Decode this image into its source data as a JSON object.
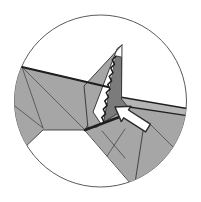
{
  "figure": {
    "background": "#ffffff"
  },
  "canvas": {
    "width": 201,
    "height": 202
  },
  "lens": {
    "cx": 100.5,
    "cy": 101,
    "r": 86
  },
  "palette": {
    "paper_gray": "#a6a6a6",
    "paper_dark": "#7b7b7b",
    "edge_strip": "#b5b5b5",
    "outline": "#3d3d3d",
    "crease": "#4a4a4a",
    "heavy_line": "#1f1f1f",
    "serration": "#1c1c1c",
    "circle_stroke": "#5a5a5a",
    "white": "#ffffff",
    "arrow_fill": "#ffffff",
    "arrow_outline": "#2b2b2b"
  },
  "shapes": [
    {
      "name": "lens-circle",
      "kind": "circle",
      "cx": 100.5,
      "cy": 101,
      "r": 86,
      "fill": "white",
      "stroke": "circle_stroke",
      "width": 1,
      "clip": false
    },
    {
      "name": "left-panel",
      "kind": "polygon",
      "points": [
        [
          22,
          67
        ],
        [
          108,
          87
        ],
        [
          85,
          130
        ],
        [
          43,
          130
        ],
        [
          23,
          149
        ],
        [
          5,
          142
        ],
        [
          5,
          72
        ]
      ],
      "fill": "paper_gray",
      "stroke": "outline",
      "width": 0.9,
      "clip": true
    },
    {
      "name": "left-panel-crease-a",
      "kind": "line",
      "x1": 22,
      "y1": 67,
      "x2": 85,
      "y2": 130,
      "stroke": "crease",
      "width": 0.8,
      "clip": true
    },
    {
      "name": "left-panel-crease-b",
      "kind": "line",
      "x1": 11,
      "y1": 103,
      "x2": 43,
      "y2": 128,
      "stroke": "crease",
      "width": 0.8,
      "clip": true
    },
    {
      "name": "left-panel-crease-c",
      "kind": "line",
      "x1": 22,
      "y1": 67,
      "x2": 43,
      "y2": 128,
      "stroke": "crease",
      "width": 0.8,
      "clip": true
    },
    {
      "name": "lower-panel",
      "kind": "polygon",
      "points": [
        [
          85,
          130
        ],
        [
          107,
          103
        ],
        [
          200,
          116
        ],
        [
          200,
          215
        ],
        [
          158,
          215
        ]
      ],
      "fill": "paper_gray",
      "stroke": "outline",
      "width": 0.9,
      "clip": true
    },
    {
      "name": "lower-panel-crease-a",
      "kind": "line",
      "x1": 102,
      "y1": 131,
      "x2": 125,
      "y2": 158,
      "stroke": "crease",
      "width": 0.8,
      "clip": true
    },
    {
      "name": "lower-panel-crease-b",
      "kind": "line",
      "x1": 125,
      "y1": 129,
      "x2": 107,
      "y2": 156,
      "stroke": "crease",
      "width": 0.8,
      "clip": true
    },
    {
      "name": "lower-panel-crease-c",
      "kind": "line",
      "x1": 143,
      "y1": 131,
      "x2": 135,
      "y2": 183,
      "stroke": "crease",
      "width": 1.1,
      "clip": true
    },
    {
      "name": "lower-panel-crease-d",
      "kind": "line",
      "x1": 148,
      "y1": 122,
      "x2": 178,
      "y2": 152,
      "stroke": "crease",
      "width": 0.8,
      "clip": true
    },
    {
      "name": "paper-edge-strip",
      "kind": "polygon",
      "points": [
        [
          120,
          97
        ],
        [
          187,
          108.5
        ],
        [
          189,
          116
        ],
        [
          106,
          103.5
        ]
      ],
      "fill": "edge_strip",
      "stroke": "none",
      "width": 0,
      "clip": true
    },
    {
      "name": "paper-edge-strip-top-line",
      "kind": "line",
      "x1": 120,
      "y1": 97,
      "x2": 187,
      "y2": 108.5,
      "stroke": "heavy_line",
      "width": 1.7,
      "clip": true
    },
    {
      "name": "paper-edge-strip-bottom-line",
      "kind": "line",
      "x1": 106,
      "y1": 103.5,
      "x2": 189,
      "y2": 116,
      "stroke": "heavy_line",
      "width": 1.3,
      "clip": true
    },
    {
      "name": "pocket-face",
      "kind": "polygon",
      "points": [
        [
          116,
          56
        ],
        [
          121.5,
          57
        ],
        [
          121.5,
          99
        ],
        [
          128,
          107
        ],
        [
          104,
          122
        ]
      ],
      "fill": "paper_dark",
      "stroke": "arrow_outline",
      "width": 0.8,
      "clip": true
    },
    {
      "name": "white-gap",
      "kind": "polygon",
      "points": [
        [
          117,
          49
        ],
        [
          93,
          112
        ],
        [
          101,
          124
        ],
        [
          103,
          121
        ],
        [
          115,
          55
        ]
      ],
      "fill": "white",
      "stroke": "none",
      "width": 0,
      "clip": true
    },
    {
      "name": "spike-flap",
      "kind": "polygon",
      "points": [
        [
          122,
          45
        ],
        [
          84,
          86
        ],
        [
          88,
          128
        ],
        [
          97,
          127
        ],
        [
          101,
          124
        ],
        [
          93,
          112
        ],
        [
          117,
          49
        ]
      ],
      "fill": "paper_gray",
      "stroke": "outline",
      "width": 1,
      "clip": true
    },
    {
      "name": "pocket-serrated-edge",
      "kind": "polyline",
      "points": [
        [
          104,
          122
        ],
        [
          101.8,
          117.4
        ],
        [
          105.5,
          113.8
        ],
        [
          103.3,
          109.2
        ],
        [
          107,
          105.6
        ],
        [
          104.8,
          100.9
        ],
        [
          108.5,
          97.3
        ],
        [
          106.3,
          92.7
        ],
        [
          110,
          89.1
        ],
        [
          107.8,
          84.5
        ],
        [
          111.5,
          80.9
        ],
        [
          109.3,
          76.3
        ],
        [
          113,
          72.7
        ],
        [
          110.8,
          68
        ],
        [
          114.5,
          64.4
        ],
        [
          112.3,
          59.8
        ],
        [
          116,
          56.2
        ]
      ],
      "fill": "none",
      "stroke": "serration",
      "width": 1.5,
      "clip": true
    },
    {
      "name": "spike-right-edge",
      "kind": "line",
      "x1": 122,
      "y1": 45,
      "x2": 121.5,
      "y2": 99,
      "stroke": "outline",
      "width": 1,
      "clip": true
    },
    {
      "name": "main-fold-heavy-edge",
      "kind": "line",
      "x1": 22,
      "y1": 67,
      "x2": 108,
      "y2": 87,
      "stroke": "heavy_line",
      "width": 2.3,
      "clip": true
    },
    {
      "name": "pleat-shadow-heavy-edge",
      "kind": "line",
      "x1": 85,
      "y1": 130,
      "x2": 130,
      "y2": 113,
      "stroke": "heavy_line",
      "width": 2.6,
      "clip": true
    },
    {
      "name": "push-arrow",
      "kind": "polygon",
      "points": [
        [
          115,
          107
        ],
        [
          130.9,
          106.3
        ],
        [
          128.5,
          110
        ],
        [
          150.4,
          124.1
        ],
        [
          145.6,
          131.9
        ],
        [
          123.7,
          117.8
        ],
        [
          121.3,
          121.6
        ]
      ],
      "fill": "arrow_fill",
      "stroke": "arrow_outline",
      "width": 1.4,
      "round": true,
      "clip": true
    }
  ]
}
